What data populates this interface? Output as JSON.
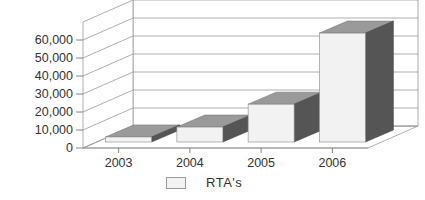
{
  "chart_data": {
    "type": "bar",
    "style": "3d-column",
    "title": "",
    "xlabel": "",
    "ylabel": "",
    "categories": [
      "2003",
      "2004",
      "2005",
      "2006"
    ],
    "series": [
      {
        "name": "RTA's",
        "values": [
          2800,
          8300,
          21000,
          60500
        ]
      }
    ],
    "yticks": [
      "0",
      "10,000",
      "20,000",
      "30,000",
      "40,000",
      "50,000",
      "60,000"
    ],
    "ylim": [
      0,
      70000
    ],
    "grid": true,
    "legend_position": "bottom"
  },
  "colors": {
    "front": "#f2f2f2",
    "top": "#9a9a9a",
    "side": "#555555",
    "grid": "#9a9a9a"
  },
  "legend": {
    "label": "RTA's"
  }
}
